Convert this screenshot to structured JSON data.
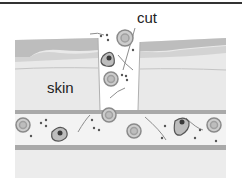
{
  "figure": {
    "labels": {
      "cut": "cut",
      "skin": "skin"
    },
    "colors": {
      "top_rule": "#333333",
      "epidermis_dark": "#b9b9b9",
      "epidermis_mid": "#cfcfcf",
      "dermis": "#e6e6e6",
      "dermis_light": "#eeeeee",
      "vessel_wall": "#a9a9a9",
      "vessel_lumen": "#f3f3f3",
      "lower_tissue": "#ececec",
      "cell_outline": "#8a8a8a",
      "cell_fill": "#c9c9c9",
      "platelet": "#555555",
      "white_cell_nucleus": "#3a3a3a"
    },
    "elements": {
      "red_blood_cells": 7,
      "white_blood_cells": 3,
      "fibrin_strands": 6
    }
  }
}
